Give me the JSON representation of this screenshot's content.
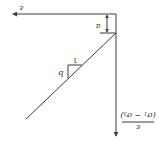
{
  "diagram": {
    "orientation_rotation_deg": 180,
    "x_axis": {
      "label": "ε"
    },
    "y_axis": {
      "label_numerator": "ε",
      "label_denominator_open": "(",
      "label_sigma1": "σ",
      "label_sub1": "1",
      "label_minus": " − ",
      "label_sigma3": "σ",
      "label_sub3": "3",
      "label_denominator_close": ")"
    },
    "intercept": {
      "label": "a"
    },
    "slope_triangle": {
      "run_label": "1",
      "rise_label": "b"
    },
    "colors": {
      "line": "#3a3a3a",
      "text": "#333333",
      "background": "#ffffff"
    }
  }
}
